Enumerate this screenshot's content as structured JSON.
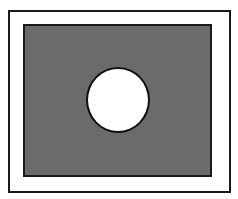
{
  "diagram": {
    "shapes": [
      {
        "type": "rectangle",
        "role": "outer-frame",
        "fill": "#ffffff",
        "stroke": "#1a1a1a"
      },
      {
        "type": "rectangle",
        "role": "inner-panel",
        "fill": "#6b6b6b",
        "stroke": "#1a1a1a"
      },
      {
        "type": "circle",
        "role": "hole",
        "fill": "#ffffff",
        "stroke": "#111111"
      }
    ]
  }
}
